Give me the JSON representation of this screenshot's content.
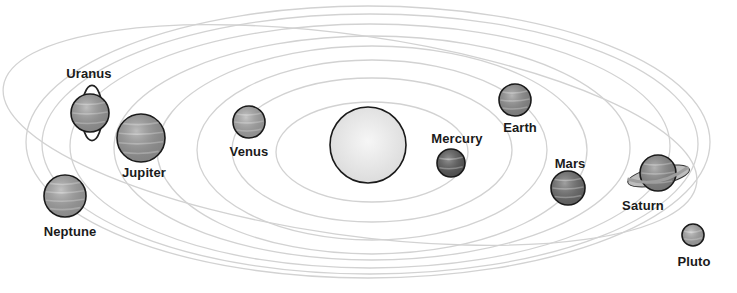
{
  "diagram": {
    "sun": {
      "cx": 368,
      "cy": 145,
      "r": 38,
      "fill": "#ececec"
    },
    "orbit_color": "#d2d2d2",
    "orbits": [
      {
        "name": "mercury-orbit",
        "cx": 372,
        "cy": 152,
        "rx": 96,
        "ry": 50
      },
      {
        "name": "venus-orbit",
        "cx": 372,
        "cy": 150,
        "rx": 140,
        "ry": 72
      },
      {
        "name": "earth-orbit",
        "cx": 372,
        "cy": 150,
        "rx": 175,
        "ry": 90
      },
      {
        "name": "mars-orbit",
        "cx": 372,
        "cy": 150,
        "rx": 215,
        "ry": 104
      },
      {
        "name": "jupiter-orbit",
        "cx": 372,
        "cy": 148,
        "rx": 258,
        "ry": 112
      },
      {
        "name": "saturn-orbit",
        "cx": 370,
        "cy": 146,
        "rx": 300,
        "ry": 122
      },
      {
        "name": "uranus-orbit",
        "cx": 370,
        "cy": 144,
        "rx": 328,
        "ry": 130
      },
      {
        "name": "neptune-orbit",
        "cx": 368,
        "cy": 142,
        "rx": 342,
        "ry": 136
      }
    ],
    "pluto_orbit": {
      "cx": 350,
      "cy": 135,
      "rx": 350,
      "ry": 100,
      "rotate": 8
    },
    "planets": [
      {
        "name": "Mercury",
        "cx": 451,
        "cy": 163,
        "r": 14,
        "fill": "#5a5a5a",
        "label_x": 457,
        "label_y": 131
      },
      {
        "name": "Venus",
        "cx": 249,
        "cy": 122,
        "r": 16,
        "fill": "#a8a8a8",
        "label_x": 249,
        "label_y": 144
      },
      {
        "name": "Earth",
        "cx": 515,
        "cy": 100,
        "r": 16,
        "fill": "#8f8f8f",
        "label_x": 520,
        "label_y": 120
      },
      {
        "name": "Mars",
        "cx": 568,
        "cy": 188,
        "r": 17,
        "fill": "#6d6d6d",
        "label_x": 570,
        "label_y": 156
      },
      {
        "name": "Jupiter",
        "cx": 141,
        "cy": 138,
        "r": 24,
        "fill": "#9a9a9a",
        "label_x": 144,
        "label_y": 165
      },
      {
        "name": "Saturn",
        "cx": 658,
        "cy": 173,
        "r": 18,
        "fill": "#8a8a8a",
        "label_x": 643,
        "label_y": 198,
        "ring": true
      },
      {
        "name": "Uranus",
        "cx": 90,
        "cy": 113,
        "r": 19,
        "fill": "#9c9c9c",
        "label_x": 89,
        "label_y": 66,
        "vertical_ring": true
      },
      {
        "name": "Neptune",
        "cx": 65,
        "cy": 196,
        "r": 21,
        "fill": "#a3a3a3",
        "label_x": 70,
        "label_y": 224
      },
      {
        "name": "Pluto",
        "cx": 693,
        "cy": 235,
        "r": 11,
        "fill": "#a8a8a8",
        "label_x": 694,
        "label_y": 254
      }
    ]
  },
  "labels": {
    "mercury": "Mercury",
    "venus": "Venus",
    "earth": "Earth",
    "mars": "Mars",
    "jupiter": "Jupiter",
    "saturn": "Saturn",
    "uranus": "Uranus",
    "neptune": "Neptune",
    "pluto": "Pluto"
  }
}
